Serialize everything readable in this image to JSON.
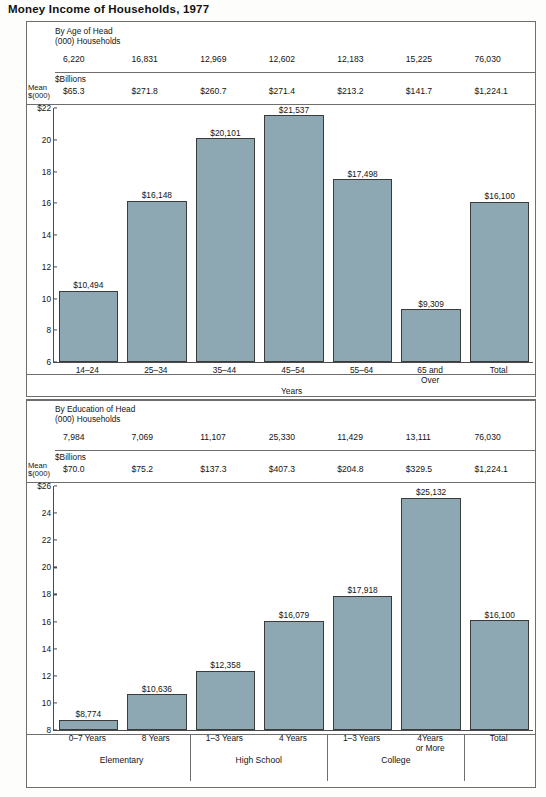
{
  "title": "Money Income of Households, 1977",
  "charts": [
    {
      "id": "by-age",
      "caption": "By Age of Head\n(000) Households",
      "mean_label": "Mean\n$(000)",
      "billions_label": "$Billions",
      "households": [
        "6,220",
        "16,831",
        "12,969",
        "12,602",
        "12,183",
        "15,225",
        "76,030"
      ],
      "aggregate_income": [
        "$65.3",
        "$271.8",
        "$260.7",
        "$271.4",
        "$213.2",
        "$141.7",
        "$1,224.1"
      ],
      "axis_title": "Years",
      "yticks": [
        "$22",
        "20",
        "18",
        "16",
        "14",
        "12",
        "10",
        "8",
        "6"
      ],
      "categories": [
        "14–24",
        "25–34",
        "35–44",
        "45–54",
        "55–64",
        "65 and\nOver",
        "Total"
      ],
      "bar_labels": [
        "$10,494",
        "$16,148",
        "$20,101",
        "$21,537",
        "$17,498",
        "$9,309",
        "$16,100"
      ]
    },
    {
      "id": "by-education",
      "caption": "By Education of Head\n(000) Households",
      "mean_label": "Mean\n$(000)",
      "billions_label": "$Billions",
      "households": [
        "7,984",
        "7,069",
        "11,107",
        "25,330",
        "11,429",
        "13,111",
        "76,030"
      ],
      "aggregate_income": [
        "$70.0",
        "$75.2",
        "$137.3",
        "$407.3",
        "$204.8",
        "$329.5",
        "$1,224.1"
      ],
      "yticks": [
        "$26",
        "24",
        "22",
        "20",
        "18",
        "16",
        "14",
        "12",
        "10",
        "8"
      ],
      "categories": [
        "0–7  Years",
        "8  Years",
        "1–3  Years",
        "4  Years",
        "1–3  Years",
        "4Years\nor More",
        "Total"
      ],
      "bar_labels": [
        "$8,774",
        "$10,636",
        "$12,358",
        "$16,079",
        "$17,918",
        "$25,132",
        "$16,100"
      ],
      "groups": [
        "Elementary",
        "High School",
        "College"
      ]
    }
  ],
  "chart_data": [
    {
      "type": "bar",
      "title": "Money Income of Households, 1977 — By Age of Head",
      "xlabel": "Years",
      "ylabel": "Mean $(000)",
      "ylim": [
        6,
        22
      ],
      "yticks": [
        6,
        8,
        10,
        12,
        14,
        16,
        18,
        20,
        22
      ],
      "grid": false,
      "legend": "none",
      "categories": [
        "14-24",
        "25-34",
        "35-44",
        "45-54",
        "55-64",
        "65 and Over",
        "Total"
      ],
      "values": [
        10494,
        16148,
        20101,
        21537,
        17498,
        9309,
        16100
      ],
      "value_labels": [
        "$10,494",
        "$16,148",
        "$20,101",
        "$21,537",
        "$17,498",
        "$9,309",
        "$16,100"
      ],
      "households_000": [
        6220,
        16831,
        12969,
        12602,
        12183,
        15225,
        76030
      ],
      "aggregate_income_billions": [
        65.3,
        271.8,
        260.7,
        271.4,
        213.2,
        141.7,
        1224.1
      ]
    },
    {
      "type": "bar",
      "title": "Money Income of Households, 1977 — By Education of Head",
      "xlabel": "",
      "ylabel": "Mean $(000)",
      "ylim": [
        8,
        26
      ],
      "yticks": [
        8,
        10,
        12,
        14,
        16,
        18,
        20,
        22,
        24,
        26
      ],
      "grid": false,
      "legend": "none",
      "categories": [
        "0-7 Years",
        "8 Years",
        "1-3 Years",
        "4 Years",
        "1-3 Years",
        "4 Years or More",
        "Total"
      ],
      "groups": [
        "Elementary",
        "Elementary",
        "High School",
        "High School",
        "College",
        "College",
        "Total"
      ],
      "values": [
        8774,
        10636,
        12358,
        16079,
        17918,
        25132,
        16100
      ],
      "value_labels": [
        "$8,774",
        "$10,636",
        "$12,358",
        "$16,079",
        "$17,918",
        "$25,132",
        "$16,100"
      ],
      "households_000": [
        7984,
        7069,
        11107,
        25330,
        11429,
        13111,
        76030
      ],
      "aggregate_income_billions": [
        70.0,
        75.2,
        137.3,
        407.3,
        204.8,
        329.5,
        1224.1
      ]
    }
  ],
  "colors": {
    "bar_fill": "#8da8b3",
    "bar_stroke": "#3b3b3b",
    "frame": "#6e6e6e",
    "text": "#141414"
  }
}
